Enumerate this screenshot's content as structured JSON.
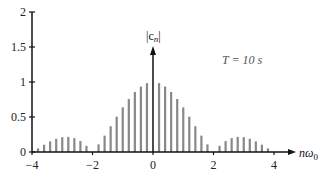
{
  "chart_data": {
    "type": "bar",
    "title": "",
    "xlabel": "nω0",
    "ylabel": "|c_n|",
    "annotation": "T = 10 s",
    "xlim": [
      -4,
      4
    ],
    "ylim": [
      0,
      2
    ],
    "x_ticks": [
      -4,
      -2,
      0,
      2,
      4
    ],
    "x_tick_labels": [
      "−4",
      "−2",
      "0",
      "2",
      "4"
    ],
    "y_ticks": [
      0,
      0.5,
      1,
      1.5,
      2
    ],
    "y_tick_labels": [
      "0",
      "0.5",
      "1",
      "1.5",
      "2"
    ],
    "grid": false,
    "bar_color": "#888888",
    "axis_color": "#111111",
    "x": [
      -3.8,
      -3.6,
      -3.4,
      -3.2,
      -3.0,
      -2.8,
      -2.6,
      -2.4,
      -2.2,
      -2.0,
      -1.8,
      -1.6,
      -1.4,
      -1.2,
      -1.0,
      -0.8,
      -0.6,
      -0.4,
      -0.2,
      0,
      0.2,
      0.4,
      0.6,
      0.8,
      1.0,
      1.2,
      1.4,
      1.6,
      1.8,
      2.0,
      2.2,
      2.4,
      2.6,
      2.8,
      3.0,
      3.2,
      3.4,
      3.6,
      3.8
    ],
    "values": [
      0.052,
      0.104,
      0.151,
      0.189,
      0.212,
      0.216,
      0.198,
      0.156,
      0.089,
      0.0,
      0.109,
      0.234,
      0.368,
      0.505,
      0.637,
      0.757,
      0.858,
      0.935,
      0.984,
      1.0,
      0.984,
      0.935,
      0.858,
      0.757,
      0.637,
      0.505,
      0.368,
      0.234,
      0.109,
      0.0,
      0.089,
      0.156,
      0.198,
      0.216,
      0.212,
      0.189,
      0.151,
      0.104,
      0.052
    ]
  },
  "labels": {
    "ylabel_main": "|c",
    "ylabel_sub": "n",
    "ylabel_close": "|",
    "xlabel_main": "nω",
    "xlabel_sub": "0",
    "annotation": "T = 10 s"
  }
}
